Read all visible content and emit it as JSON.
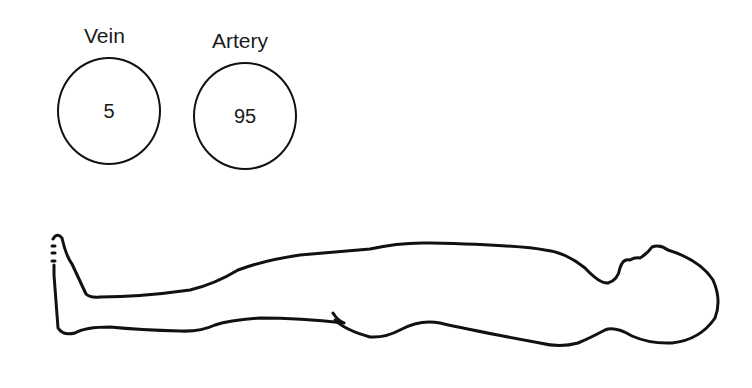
{
  "diagram": {
    "vessels": [
      {
        "label": "Vein",
        "value": "5"
      },
      {
        "label": "Artery",
        "value": "95"
      }
    ],
    "figure": "supine-human-body-outline"
  }
}
